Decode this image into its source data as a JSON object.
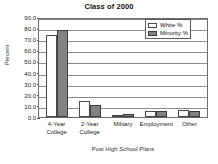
{
  "chart_data": {
    "type": "bar",
    "title": "Class of 2000",
    "xlabel": "Post High School Plans",
    "ylabel": "Percent",
    "categories": [
      "4-Year College",
      "2-Year College",
      "Military",
      "Employment",
      "Other"
    ],
    "category_lines": [
      [
        "4-Year",
        "College"
      ],
      [
        "2-Year",
        "College"
      ],
      [
        "Military",
        ""
      ],
      [
        "Employment",
        ""
      ],
      [
        "Other",
        ""
      ]
    ],
    "series": [
      {
        "name": "White %",
        "color": "#ffffff",
        "values": [
          73.5,
          14.5,
          1.5,
          5.0,
          6.0
        ]
      },
      {
        "name": "Minority %",
        "color": "#828282",
        "values": [
          78.0,
          11.0,
          2.5,
          5.0,
          5.0
        ]
      }
    ],
    "ylim": [
      0.0,
      90.0
    ],
    "ytick_values": [
      90.0,
      80.0,
      70.0,
      60.0,
      50.0,
      40.0,
      30.0,
      20.0,
      10.0,
      0.0
    ],
    "ytick_labels": [
      "90.0",
      "80.0",
      "70.0",
      "60.0",
      "50.0",
      "40.0",
      "30.0",
      "20.0",
      "10.0",
      "0.0"
    ],
    "grid": true,
    "grid_axis": "y",
    "legend_position": "top-right",
    "legend_entries": [
      "White %",
      "Minority %"
    ]
  }
}
